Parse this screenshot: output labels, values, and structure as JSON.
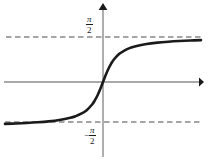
{
  "figure": {
    "background_color": "#ffffff",
    "width": 210,
    "height": 160
  },
  "labels": {
    "upper_asymptote": {
      "text": "π/2",
      "numerator": "π",
      "denominator": "2",
      "sign": ""
    },
    "lower_asymptote": {
      "text": "-π/2",
      "numerator": "π",
      "denominator": "2",
      "sign": "−"
    }
  },
  "colors": {
    "curve": "#1a1a1a",
    "axis": "#8c8c8c",
    "asymptote": "#4d4d4d",
    "text": "#1a1a1a",
    "background": "#ffffff"
  },
  "chart_data": {
    "type": "line",
    "title": "",
    "subtitle": "",
    "xlabel": "",
    "ylabel": "",
    "function": "y = arctan(x)",
    "grid": false,
    "legend": null,
    "xlim": [
      -9,
      9
    ],
    "ylim": [
      -1.9635,
      1.9635
    ],
    "axis_origin_px": [
      103,
      82
    ],
    "x_ticks": [],
    "y_ticks": [
      {
        "value": 1.5708,
        "label": "π/2"
      },
      {
        "value": -1.5708,
        "label": "-π/2"
      }
    ],
    "annotations": [
      {
        "type": "horizontal-asymptote",
        "value": 1.5708,
        "label": "π/2",
        "style": "dashed",
        "y_px": 37,
        "x_start_px": 6,
        "x_end_px": 201
      },
      {
        "type": "horizontal-asymptote",
        "value": -1.5708,
        "label": "-π/2",
        "style": "dashed",
        "y_px": 122,
        "x_start_px": 5,
        "x_end_px": 200
      }
    ],
    "axes": [
      {
        "name": "x-axis",
        "orientation": "horizontal",
        "arrow": "right",
        "y_px": 82,
        "x_start_px": 4,
        "x_end_px": 203
      },
      {
        "name": "y-axis",
        "orientation": "vertical",
        "arrow": "up",
        "x_px": 103,
        "y_start_px": 157,
        "y_end_px": 4
      }
    ],
    "series": [
      {
        "name": "arctan(x)",
        "color": "#1a1a1a",
        "x": [
          -9.0,
          -8.0,
          -7.0,
          -6.0,
          -5.0,
          -4.0,
          -3.0,
          -2.5,
          -2.0,
          -1.5,
          -1.0,
          -0.75,
          -0.5,
          -0.25,
          0.0,
          0.25,
          0.5,
          0.75,
          1.0,
          1.5,
          2.0,
          2.5,
          3.0,
          4.0,
          5.0,
          6.0,
          7.0,
          8.0,
          9.0
        ],
        "values": [
          -1.4601,
          -1.4464,
          -1.4289,
          -1.4056,
          -1.3734,
          -1.3258,
          -1.249,
          -1.1903,
          -1.1071,
          -0.9828,
          -0.7854,
          -0.6435,
          -0.4636,
          -0.245,
          0.0,
          0.245,
          0.4636,
          0.6435,
          0.7854,
          0.9828,
          1.1071,
          1.1903,
          1.249,
          1.3258,
          1.3734,
          1.4056,
          1.4289,
          1.4464,
          1.4601
        ]
      }
    ]
  }
}
